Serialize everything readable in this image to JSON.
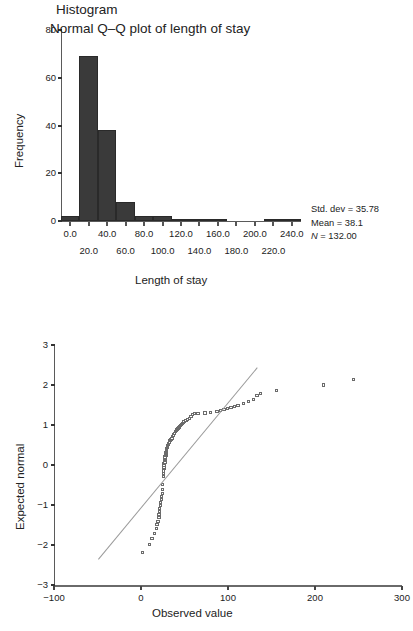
{
  "figure": {
    "panels": [
      "histogram",
      "normal-qq-plot"
    ]
  },
  "histogram": {
    "title": "Histogram",
    "xlabel": "Length of stay",
    "ylabel": "Frequency",
    "stats": {
      "std_dev_label": "Std. dev = 35.78",
      "mean_label": "Mean = 38.1",
      "n_symbol": "N",
      "n_label": " = 132.00"
    },
    "yticks": [
      "0",
      "20",
      "40",
      "60",
      "80"
    ],
    "xticks_upper": [
      "0.0",
      "40.0",
      "80.0",
      "120.0",
      "160.0",
      "200.0",
      "240.0"
    ],
    "xticks_lower": [
      "20.0",
      "60.0",
      "100.0",
      "140.0",
      "180.0",
      "220.0"
    ]
  },
  "qq": {
    "title": "Normal Q–Q plot of length of stay",
    "xlabel": "Observed value",
    "ylabel": "Expected normal",
    "yticks": [
      "3",
      "2",
      "1",
      "0",
      "−1",
      "−2",
      "−3"
    ],
    "xticks": [
      "−100",
      "0",
      "100",
      "200",
      "300"
    ]
  },
  "chart_data": [
    {
      "type": "bar",
      "title": "Histogram",
      "xlabel": "Length of stay",
      "ylabel": "Frequency",
      "xlim": [
        -10,
        250
      ],
      "ylim": [
        0,
        80
      ],
      "grid": false,
      "legend": null,
      "bin_width": 20,
      "bin_starts": [
        -10,
        10,
        30,
        50,
        70,
        90,
        110,
        130,
        150,
        170,
        190,
        210,
        230
      ],
      "categories": [
        "-10–10",
        "10–30",
        "30–50",
        "50–70",
        "70–90",
        "90–110",
        "110–130",
        "130–150",
        "150–170",
        "170–190",
        "190–210",
        "210–230",
        "230–250"
      ],
      "values": [
        2,
        69,
        38,
        8,
        2,
        2,
        1,
        1,
        0.4,
        0,
        0,
        1,
        1
      ],
      "annotations": [
        "Std. dev = 35.78",
        "Mean = 38.1",
        "N = 132.00"
      ],
      "summary": {
        "std_dev": 35.78,
        "mean": 38.1,
        "n": 132.0
      }
    },
    {
      "type": "scatter",
      "title": "Normal Q–Q plot of length of stay",
      "xlabel": "Observed value",
      "ylabel": "Expected normal",
      "xlim": [
        -100,
        300
      ],
      "ylim": [
        -3,
        3
      ],
      "grid": false,
      "reference_line": {
        "x": [
          -50,
          133
        ],
        "y": [
          -2.35,
          2.45
        ]
      },
      "x": [
        2,
        10,
        13,
        16,
        18,
        19,
        20,
        21,
        21,
        22,
        22,
        23,
        23,
        24,
        24,
        25,
        25,
        25,
        26,
        26,
        26,
        27,
        27,
        27,
        27,
        28,
        28,
        28,
        28,
        28,
        29,
        29,
        29,
        29,
        30,
        30,
        30,
        30,
        31,
        31,
        31,
        32,
        32,
        33,
        34,
        35,
        36,
        37,
        38,
        39,
        40,
        41,
        42,
        43,
        44,
        45,
        46,
        47,
        48,
        49,
        50,
        52,
        54,
        56,
        58,
        60,
        62,
        64,
        66,
        74,
        80,
        88,
        92,
        96,
        100,
        104,
        108,
        112,
        118,
        124,
        130,
        134,
        138,
        156,
        210,
        245
      ],
      "y": [
        -2.2,
        -2.0,
        -1.85,
        -1.72,
        -1.6,
        -1.5,
        -1.42,
        -1.33,
        -1.25,
        -1.18,
        -1.1,
        -1.02,
        -0.95,
        -0.88,
        -0.8,
        -0.72,
        -0.63,
        -0.5,
        -0.3,
        -0.22,
        -0.16,
        -0.1,
        -0.06,
        -0.02,
        0.02,
        0.06,
        0.1,
        0.13,
        0.16,
        0.19,
        0.22,
        0.25,
        0.28,
        0.3,
        0.33,
        0.35,
        0.38,
        0.4,
        0.42,
        0.45,
        0.48,
        0.5,
        0.53,
        0.56,
        0.6,
        0.63,
        0.66,
        0.7,
        0.74,
        0.78,
        0.82,
        0.86,
        0.88,
        0.9,
        0.92,
        0.95,
        0.98,
        1.0,
        1.03,
        1.06,
        1.08,
        1.1,
        1.13,
        1.16,
        1.2,
        1.26,
        1.27,
        1.28,
        1.28,
        1.29,
        1.3,
        1.33,
        1.35,
        1.37,
        1.4,
        1.42,
        1.45,
        1.48,
        1.52,
        1.58,
        1.62,
        1.72,
        1.78,
        1.85,
        1.99,
        2.13,
        2.38
      ]
    }
  ]
}
